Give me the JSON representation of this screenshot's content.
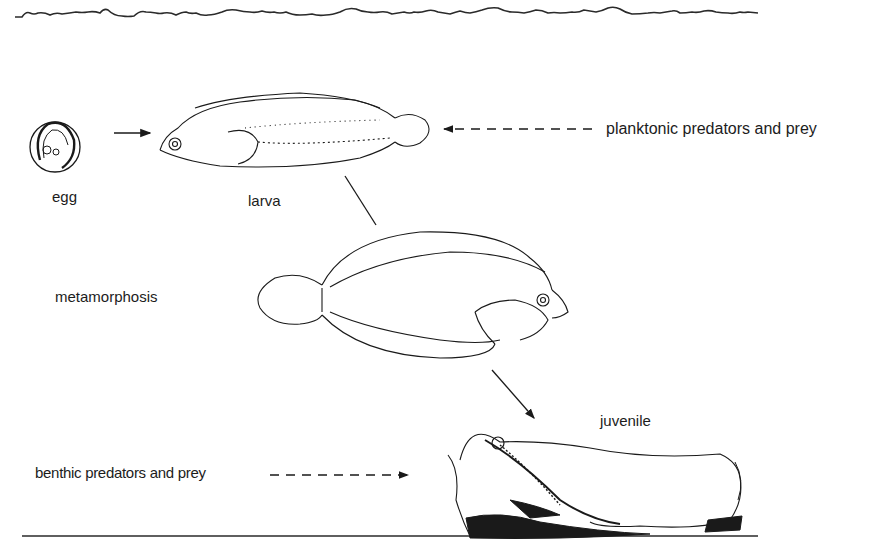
{
  "diagram": {
    "stages": [
      {
        "id": "egg",
        "label": "egg"
      },
      {
        "id": "larva",
        "label": "larva"
      },
      {
        "id": "metamorphosis",
        "label": "metamorphosis"
      },
      {
        "id": "juvenile",
        "label": "juvenile"
      }
    ],
    "influences": {
      "planktonic": "planktonic predators and prey",
      "benthic": "benthic predators and prey"
    },
    "lines": {
      "water_surface": "water-surface",
      "sea_floor": "sea-floor"
    },
    "colors": {
      "ink": "#1a1a1a",
      "background": "#ffffff"
    }
  }
}
